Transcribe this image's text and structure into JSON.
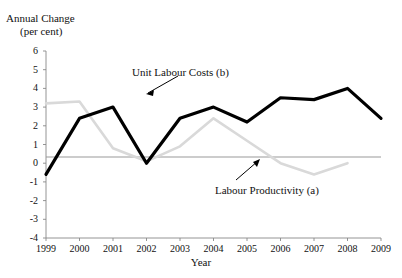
{
  "chart_data": {
    "type": "line",
    "title": "",
    "ylabel": "Annual Change (per cent)",
    "ylabel_line1": "Annual Change",
    "ylabel_line2": "(per cent)",
    "xlabel": "Year",
    "x": [
      1999,
      2000,
      2001,
      2002,
      2003,
      2004,
      2005,
      2006,
      2007,
      2008,
      2009
    ],
    "xticklabels": [
      "1999",
      "2000",
      "2001",
      "2002",
      "2003",
      "2004",
      "2005",
      "2006",
      "2007",
      "2008",
      "2009"
    ],
    "yticklabels": [
      "6",
      "5",
      "4",
      "3",
      "2",
      "1",
      "0",
      "-1",
      "-2",
      "-3",
      "-4"
    ],
    "yticks": [
      6,
      5,
      4,
      3,
      2,
      1,
      0,
      -1,
      -2,
      -3,
      -4
    ],
    "ylim": [
      -4,
      6
    ],
    "xlim": [
      1999,
      2009
    ],
    "grid": false,
    "legend_position": "inline-annotations",
    "series": [
      {
        "name": "Unit Labour Costs (b)",
        "color": "#000000",
        "width": 3.2,
        "values": [
          -0.6,
          2.4,
          3.0,
          0.0,
          2.4,
          3.0,
          2.2,
          3.5,
          3.4,
          4.0,
          2.4
        ]
      },
      {
        "name": "Labour Productivity (a)",
        "color": "#d9d9d9",
        "width": 2.6,
        "values": [
          3.2,
          3.3,
          0.8,
          0.1,
          0.9,
          2.4,
          1.2,
          0.0,
          -0.6,
          0.0,
          null
        ]
      }
    ],
    "annotations": [
      {
        "text": "Unit Labour Costs (b)",
        "target_x": 2002.6,
        "target_y": 3.15
      },
      {
        "text": "Labour Productivity (a)",
        "target_x": 2007.0,
        "target_y": 0.0
      }
    ]
  }
}
